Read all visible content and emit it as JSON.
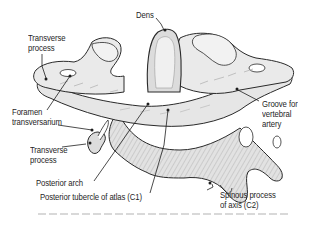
{
  "figure": {
    "colors": {
      "bone_fill": "#e4e4e4",
      "bone_light": "#f2f2f2",
      "bone_shade": "#b8b8b8",
      "outline": "#2a2a2a",
      "leader_line": "#1e1e1e",
      "text": "#1e1e1e",
      "background": "#ffffff"
    },
    "labels": {
      "dens": "Dens",
      "transverse_process_top": [
        "Transverse",
        "process"
      ],
      "foramen_transversarium": [
        "Foramen",
        "transversarium"
      ],
      "transverse_process_bottom": [
        "Transverse",
        "process"
      ],
      "posterior_arch": "Posterior arch",
      "posterior_tubercle": "Posterior tubercle of atlas (C1)",
      "groove": [
        "Groove for",
        "vertebral",
        "artery"
      ],
      "spinous_process": [
        "Spinous process",
        "of axis (C2)"
      ]
    }
  }
}
